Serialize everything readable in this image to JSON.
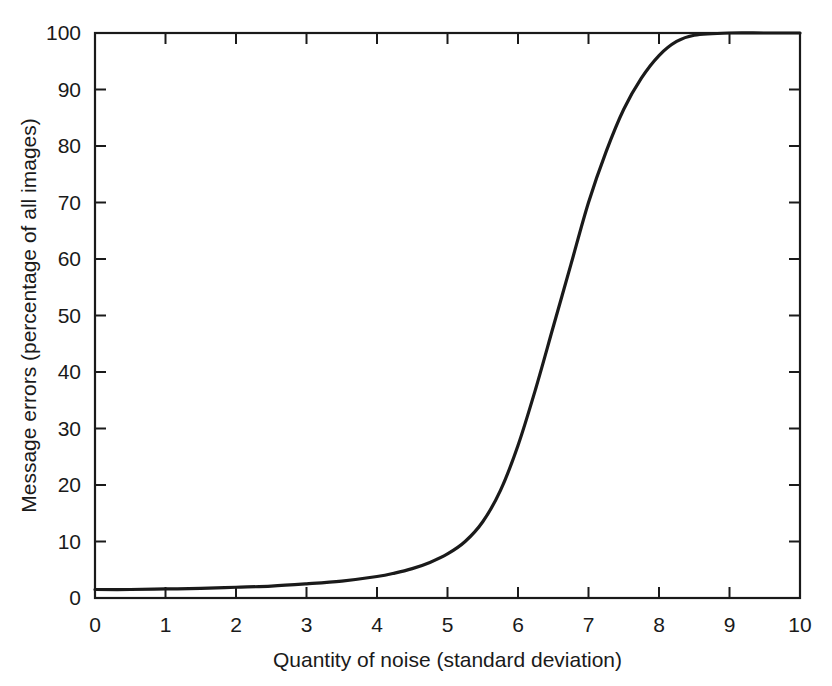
{
  "chart_data": {
    "type": "line",
    "title": "",
    "subtitle": "",
    "xlabel": "Quantity of noise (standard deviation)",
    "ylabel": "Message errors (percentage of all images)",
    "xlim": [
      0,
      10
    ],
    "ylim": [
      0,
      100
    ],
    "xticks": [
      0,
      1,
      2,
      3,
      4,
      5,
      6,
      7,
      8,
      9,
      10
    ],
    "yticks": [
      0,
      10,
      20,
      30,
      40,
      50,
      60,
      70,
      80,
      90,
      100
    ],
    "xtick_labels": [
      "0",
      "1",
      "2",
      "3",
      "4",
      "5",
      "6",
      "7",
      "8",
      "9",
      "10"
    ],
    "ytick_labels": [
      "0",
      "10",
      "20",
      "30",
      "40",
      "50",
      "60",
      "70",
      "80",
      "90",
      "100"
    ],
    "grid": false,
    "legend": false,
    "legend_position": "none",
    "line_color": "#1a1a1a",
    "background_color": "#ffffff",
    "frame": "full-box",
    "tick_direction": "in",
    "annotations": [],
    "series": [
      {
        "name": "Message errors",
        "x": [
          0.0,
          0.5,
          1.0,
          1.5,
          2.0,
          2.5,
          3.0,
          3.5,
          4.0,
          4.25,
          4.5,
          4.75,
          5.0,
          5.25,
          5.5,
          5.75,
          6.0,
          6.25,
          6.5,
          6.75,
          7.0,
          7.25,
          7.5,
          7.75,
          8.0,
          8.25,
          8.5,
          9.0,
          9.5,
          10.0
        ],
        "values": [
          1.5,
          1.5,
          1.6,
          1.7,
          1.9,
          2.1,
          2.5,
          3.0,
          3.8,
          4.4,
          5.2,
          6.3,
          7.8,
          10.0,
          13.5,
          19.0,
          27.0,
          37.0,
          48.0,
          59.0,
          70.0,
          79.0,
          86.5,
          92.0,
          96.0,
          98.5,
          99.6,
          100.0,
          100.0,
          100.0
        ]
      }
    ]
  },
  "geometry": {
    "plot_left": 95,
    "plot_right": 800,
    "plot_top": 33,
    "plot_bottom": 598,
    "xlabel_y": 667,
    "xtick_label_y": 632,
    "ylabel_x": 36
  }
}
